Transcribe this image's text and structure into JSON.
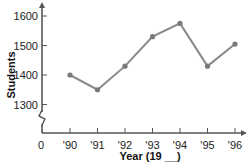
{
  "chart_data": {
    "type": "line",
    "title": "",
    "xlabel": "Year (19 __)",
    "ylabel": "Students",
    "categories": [
      "'90",
      "'91",
      "'92",
      "'93",
      "'94",
      "'95",
      "'96"
    ],
    "values": [
      1400,
      1350,
      1430,
      1530,
      1575,
      1430,
      1505
    ],
    "y_ticks": [
      "1300",
      "1400",
      "1500",
      "1600"
    ],
    "x_origin_label": "0",
    "ylim": [
      1250,
      1650
    ],
    "axis_break": true,
    "grid": false,
    "line_color": "#8a8a8a",
    "axis_color": "#555555"
  }
}
